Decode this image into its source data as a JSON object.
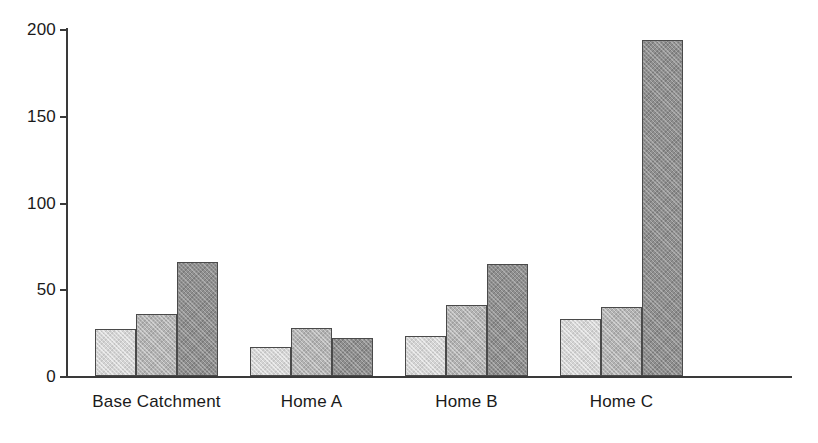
{
  "chart_data": {
    "type": "bar",
    "title": "",
    "subtitle": "",
    "xlabel": "",
    "ylabel": "",
    "categories": [
      "Base Catchment",
      "Home A",
      "Home B",
      "Home C"
    ],
    "series": [
      {
        "name": "series-1",
        "color": "#d4d4d4",
        "values": [
          27,
          17,
          23,
          33
        ]
      },
      {
        "name": "series-2",
        "color": "#b3b3b3",
        "values": [
          36,
          28,
          41,
          40
        ]
      },
      {
        "name": "series-3",
        "color": "#8f8f8f",
        "values": [
          66,
          22,
          65,
          194
        ]
      }
    ],
    "ylim": [
      0,
      200
    ],
    "yticks": [
      0,
      50,
      100,
      150,
      200
    ],
    "ytick_labels": [
      "0",
      "50",
      "100",
      "150",
      "200"
    ],
    "grid": false,
    "legend": "none",
    "axis_color": "#3a3a3a",
    "bar_edge_color": "#4a4a4a",
    "background": "#ffffff"
  }
}
